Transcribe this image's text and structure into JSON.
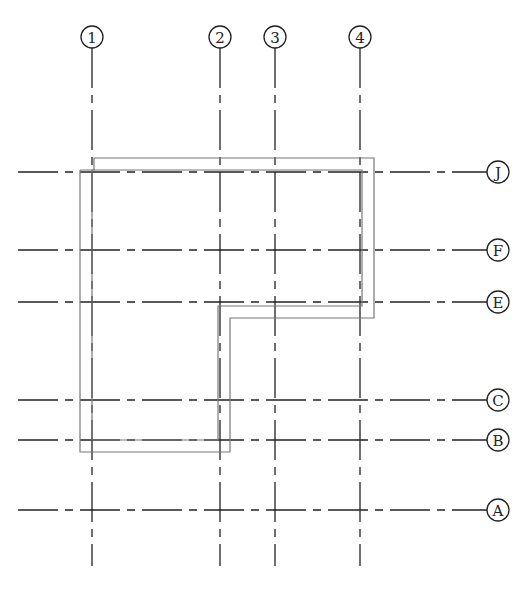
{
  "drawing": {
    "type": "structural axis grid plan",
    "vertical_axes": [
      {
        "label": "1",
        "x": 92
      },
      {
        "label": "2",
        "x": 220
      },
      {
        "label": "3",
        "x": 275
      },
      {
        "label": "4",
        "x": 360
      }
    ],
    "horizontal_axes": [
      {
        "label": "J",
        "y": 172
      },
      {
        "label": "F",
        "y": 250
      },
      {
        "label": "E",
        "y": 302
      },
      {
        "label": "C",
        "y": 400
      },
      {
        "label": "B",
        "y": 440
      },
      {
        "label": "A",
        "y": 510
      }
    ],
    "outline": {
      "shape": "L-shaped double-line wall",
      "outer": "80,170 80,452 230,452 230,318 374,318 374,158 94,158 94,170 80,170",
      "inner": "92,170 92,440 218,440 218,306 362,306 362,170 92,170"
    },
    "colors": {
      "line": "#222222",
      "wall": "#777777",
      "background": "#ffffff"
    }
  }
}
